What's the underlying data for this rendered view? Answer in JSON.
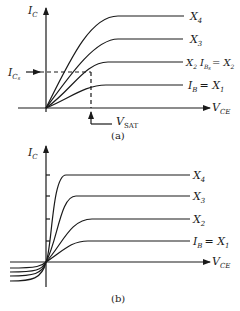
{
  "diagram": {
    "type": "transistor output characteristics",
    "panel_a": {
      "y_axis_label": "I",
      "y_axis_sub": "C",
      "x_axis_label": "V",
      "x_axis_sub": "CE",
      "curves": [
        {
          "label_main": "X",
          "label_sub": "4"
        },
        {
          "label_main": "X",
          "label_sub": "3"
        },
        {
          "label_main": "X",
          "label_sub": "2",
          "extra": "I",
          "extra_sub": "B",
          "extra_subsub": "s",
          "extra_eq": "= X",
          "extra_eq_sub": "2"
        },
        {
          "prefix": "I",
          "prefix_sub": "B",
          "eq": "= X",
          "label_sub": "1"
        }
      ],
      "ics_label": "I",
      "ics_sub": "C",
      "ics_subsub": "s",
      "vsat_label": "V",
      "vsat_sub": "SAT",
      "caption": "(a)"
    },
    "panel_b": {
      "y_axis_label": "I",
      "y_axis_sub": "C",
      "x_axis_label": "V",
      "x_axis_sub": "CE",
      "curves": [
        {
          "label_main": "X",
          "label_sub": "4"
        },
        {
          "label_main": "X",
          "label_sub": "3"
        },
        {
          "label_main": "X",
          "label_sub": "2"
        },
        {
          "prefix": "I",
          "prefix_sub": "B",
          "eq": "= X",
          "label_sub": "1"
        }
      ],
      "caption": "(b)"
    }
  }
}
